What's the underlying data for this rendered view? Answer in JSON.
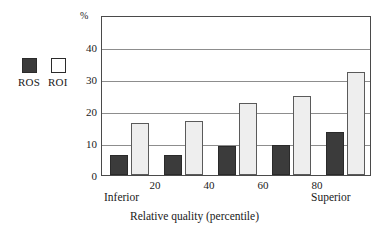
{
  "chart_data": {
    "type": "bar",
    "title": "",
    "subtitle": "",
    "xlabel": "Relative quality (percentile)",
    "ylabel": "%",
    "ylim": [
      0,
      50
    ],
    "yticks": [
      0,
      10,
      20,
      30,
      40
    ],
    "ytick_labels": [
      "0",
      "10",
      "20",
      "30",
      "40"
    ],
    "grid": true,
    "grid_axis": "y",
    "legend_position": "outside-left",
    "categories": [
      "Inferior",
      "20",
      "40",
      "60",
      "Superior"
    ],
    "x_tick_labels": [
      "20",
      "40",
      "60",
      "80"
    ],
    "x_endcap_left": "Inferior",
    "x_endcap_right": "Superior",
    "series": [
      {
        "name": "ROS",
        "color": "#3b3b3b",
        "values": [
          6.2,
          6.3,
          9.2,
          9.4,
          13.5
        ]
      },
      {
        "name": "ROI",
        "color": "#eeeeee",
        "values": [
          16.3,
          17.0,
          22.4,
          24.6,
          32.1
        ]
      }
    ]
  },
  "legend": {
    "items": [
      {
        "label": "ROS",
        "swatch": "filled-dark-square"
      },
      {
        "label": "ROI",
        "swatch": "open-white-square"
      }
    ]
  },
  "axis": {
    "y_unit_label": "%",
    "x_title": "Relative quality (percentile)"
  },
  "colors": {
    "ros_fill": "#3b3b3b",
    "roi_fill": "#eeeeee",
    "axis_line": "#4a4a4a",
    "gridline": "#8d8d8d",
    "text": "#1a1a1a",
    "background": "#ffffff"
  }
}
